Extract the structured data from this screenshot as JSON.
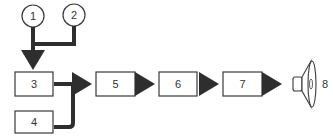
{
  "diagram": {
    "inputs": [
      {
        "id": "1",
        "label": "1"
      },
      {
        "id": "2",
        "label": "2"
      }
    ],
    "blocks": [
      {
        "id": "3",
        "label": "3"
      },
      {
        "id": "4",
        "label": "4"
      },
      {
        "id": "5",
        "label": "5"
      },
      {
        "id": "6",
        "label": "6"
      },
      {
        "id": "7",
        "label": "7"
      }
    ],
    "output": {
      "id": "8",
      "label": "8",
      "icon": "speaker-icon"
    },
    "connections": [
      {
        "from": "1",
        "to": "3"
      },
      {
        "from": "2",
        "to": "3"
      },
      {
        "from": "3",
        "to": "5"
      },
      {
        "from": "4",
        "to": "5"
      },
      {
        "from": "5",
        "to": "6"
      },
      {
        "from": "6",
        "to": "7"
      },
      {
        "from": "7",
        "to": "8"
      }
    ],
    "colors": {
      "stroke": "#3a3a3a",
      "connector": "#2e2e2e",
      "background": "#ffffff"
    }
  }
}
